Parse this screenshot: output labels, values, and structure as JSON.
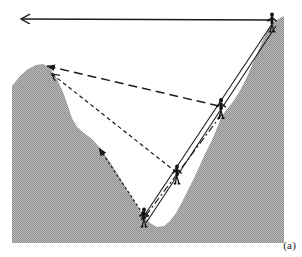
{
  "figure": {
    "caption": "(a)",
    "colors": {
      "terrain_fill": "#b0b0b0",
      "terrain_stipple": "#8f8f8f",
      "line": "#1a1a1a",
      "figure": "#111111",
      "background": "#ffffff"
    }
  },
  "terrain": {
    "label": "hillside-terrain",
    "description": "Gray stippled valley profile with a left peak, a deep V valley floor and a long right slope rising to the upper right",
    "outline_path": "M 12,257 L 12,86 L 20,76 L 28,69 L 36,65 L 43,64 L 50,68 L 57,79 L 63,92 L 68,106 L 72,118 L 77,127 L 84,133 L 92,139 L 100,148 L 110,162 L 120,178 L 130,194 L 138,207 L 144,216 L 150,223 L 157,227 L 164,226 L 170,221 L 176,213 L 182,202 L 188,190 L 194,178 L 200,165 L 206,152 L 212,140 L 217,128 L 221,118 L 226,110 L 232,103 L 238,94 L 244,83 L 250,70 L 256,56 L 262,42 L 268,30 L 274,22 L 280,18 L 284,16 L 284,257 Z",
    "left_bound_x": 12,
    "right_bound_x": 284,
    "bottom_y": 243
  },
  "observers": [
    {
      "name": "observer-summit-right",
      "x": 272,
      "y": 24,
      "scale": 1.0
    },
    {
      "name": "observer-upper-slope",
      "x": 221,
      "y": 110,
      "scale": 1.05
    },
    {
      "name": "observer-mid-slope",
      "x": 177,
      "y": 176,
      "scale": 1.0
    },
    {
      "name": "observer-valley-floor",
      "x": 144,
      "y": 219,
      "scale": 1.0
    }
  ],
  "sightlines": [
    {
      "name": "sightline-horizontal-top",
      "style": "solid",
      "from": {
        "x": 271,
        "y": 20
      },
      "to": {
        "x": 20,
        "y": 19
      },
      "arrow_at": "to",
      "description": "Horizontal solid arrow from the right summit observer pointing left off the hillside"
    },
    {
      "name": "sightline-long-dashed-to-peak",
      "style": "long-dashed",
      "from": {
        "x": 219,
        "y": 106
      },
      "to": {
        "x": 45,
        "y": 66
      },
      "arrow_at": "to",
      "description": "Long dashed line from the upper slope observer to the left peak"
    },
    {
      "name": "sightline-short-dashed-to-peak",
      "style": "short-dashed",
      "from": {
        "x": 176,
        "y": 172
      },
      "to": {
        "x": 50,
        "y": 73
      },
      "arrow_at": "to",
      "description": "Short dashed line from the mid slope observer to the left peak"
    },
    {
      "name": "sightline-dotted-to-left-slope",
      "style": "dotted",
      "from": {
        "x": 143,
        "y": 214
      },
      "to": {
        "x": 98,
        "y": 146
      },
      "arrow_at": "to",
      "description": "Dotted line from the valley floor observer to a point on the left slope"
    },
    {
      "name": "sightline-solid-summit-to-valley",
      "style": "solid",
      "from": {
        "x": 272,
        "y": 24
      },
      "to": {
        "x": 140,
        "y": 221
      },
      "arrow_at": "to",
      "description": "Solid line from the right summit observer down to the valley floor observer"
    },
    {
      "name": "sightline-solid-summit-to-valley-parallel",
      "style": "solid",
      "from": {
        "x": 276,
        "y": 26
      },
      "to": {
        "x": 145,
        "y": 224
      },
      "arrow_at": "none",
      "description": "Second solid line parallel to the summit to valley floor sightline"
    },
    {
      "name": "sightline-dashdot-upper-to-valley",
      "style": "dash-dot",
      "from": {
        "x": 222,
        "y": 114
      },
      "to": {
        "x": 141,
        "y": 223
      },
      "arrow_at": "none",
      "description": "Dash dot line from the upper slope observer toward the valley floor"
    }
  ]
}
